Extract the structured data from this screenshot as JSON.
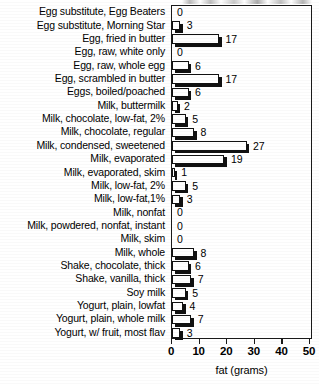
{
  "chart_data": {
    "type": "bar",
    "orientation": "horizontal",
    "title": "",
    "xlabel": "fat (grams)",
    "ylabel": "",
    "xlim": [
      0,
      50
    ],
    "xticks": [
      0,
      10,
      20,
      30,
      40,
      50
    ],
    "grid": false,
    "legend": null,
    "categories": [
      "Egg substitute, Egg Beaters",
      "Egg substitute, Morning Star",
      "Egg, fried in butter",
      "Egg, raw, white only",
      "Egg, raw, whole egg",
      "Egg, scrambled in butter",
      "Eggs, boiled/poached",
      "Milk, buttermilk",
      "Milk, chocolate, low-fat, 2%",
      "Milk, chocolate, regular",
      "Milk, condensed, sweetened",
      "Milk, evaporated",
      "Milk, evaporated, skim",
      "Milk, low-fat, 2%",
      "Milk, low-fat,1%",
      "Milk, nonfat",
      "Milk, powdered, nonfat, instant",
      "Milk, skim",
      "Milk, whole",
      "Shake, chocolate, thick",
      "Shake, vanilla, thick",
      "Soy milk",
      "Yogurt, plain, lowfat",
      "Yogurt, plain, whole milk",
      "Yogurt, w/ fruit, most flav"
    ],
    "values": [
      0,
      3,
      17,
      0,
      6,
      17,
      6,
      2,
      5,
      8,
      27,
      19,
      1,
      5,
      3,
      0,
      0,
      0,
      8,
      6,
      7,
      5,
      4,
      7,
      3
    ],
    "value_labels": [
      "0",
      "3",
      "17",
      "0",
      "6",
      "17",
      "6",
      "2",
      "5",
      "8",
      "27",
      "19",
      "1",
      "5",
      "3",
      "0",
      "0",
      "0",
      "8",
      "6",
      "7",
      "5",
      "4",
      "7",
      "3"
    ],
    "tick_labels": [
      "0",
      "10",
      "20",
      "30",
      "40",
      "50"
    ],
    "colors": {
      "bar_fill": "#ffffff",
      "bar_edge": "#111111",
      "shadow": "#111111",
      "axis": "#1a1a1a",
      "text": "#000000"
    }
  }
}
